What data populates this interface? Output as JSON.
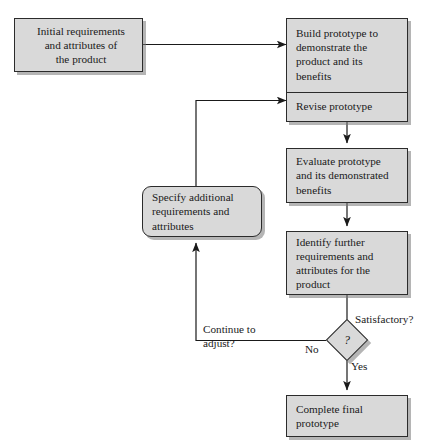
{
  "diagram": {
    "colors": {
      "node_fill": "#d9d9d9",
      "node_border": "#2b2b2b",
      "shadow": "#787878",
      "background": "#ffffff",
      "text": "#1a1a1a"
    },
    "nodes": [
      {
        "id": "initial",
        "name": "initial-requirements-box",
        "shape": "rectangle",
        "text": "Initial requirements\nand attributes of\nthe product"
      },
      {
        "id": "build",
        "name": "build-prototype-box",
        "shape": "rectangle",
        "text": "Build prototype to\ndemonstrate the\nproduct and its\nbenefits"
      },
      {
        "id": "revise",
        "name": "revise-prototype-box",
        "shape": "rectangle",
        "text": "Revise prototype"
      },
      {
        "id": "evaluate",
        "name": "evaluate-prototype-box",
        "shape": "rectangle",
        "text": "Evaluate prototype\nand its demonstrated\nbenefits"
      },
      {
        "id": "identify",
        "name": "identify-further-requirements-box",
        "shape": "rectangle",
        "text": "Identify further\nrequirements and\nattributes for the\nproduct"
      },
      {
        "id": "specify",
        "name": "specify-additional-requirements-box",
        "shape": "rounded-rectangle",
        "text": "Specify additional\nrequirements and\nattributes"
      },
      {
        "id": "complete",
        "name": "complete-final-prototype-box",
        "shape": "rectangle",
        "text": "Complete final\nprototype"
      }
    ],
    "decision": {
      "name": "satisfactory-decision-diamond",
      "symbol": "?",
      "label": "Satisfactory?"
    },
    "edge_labels": {
      "yes": "Yes",
      "no": "No",
      "continue_adjust": "Continue to\nadjust?"
    }
  }
}
